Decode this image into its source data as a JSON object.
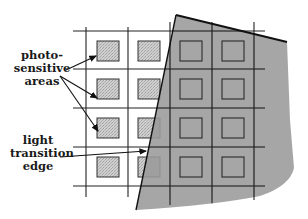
{
  "diagram": {
    "labels": {
      "photosensitive": [
        "photo-",
        "sensitive",
        "areas"
      ],
      "transition": [
        "light",
        "transition",
        "edge"
      ]
    },
    "colors": {
      "line": "#222222",
      "shade": "#9a9a9a",
      "square_fill": "#c4c4c4",
      "background": "#ffffff"
    },
    "grid": {
      "columns": 4,
      "rows": 4,
      "x_lines": [
        86,
        128,
        170,
        212
      ],
      "y_lines": [
        31,
        69,
        108,
        147,
        186
      ]
    }
  }
}
